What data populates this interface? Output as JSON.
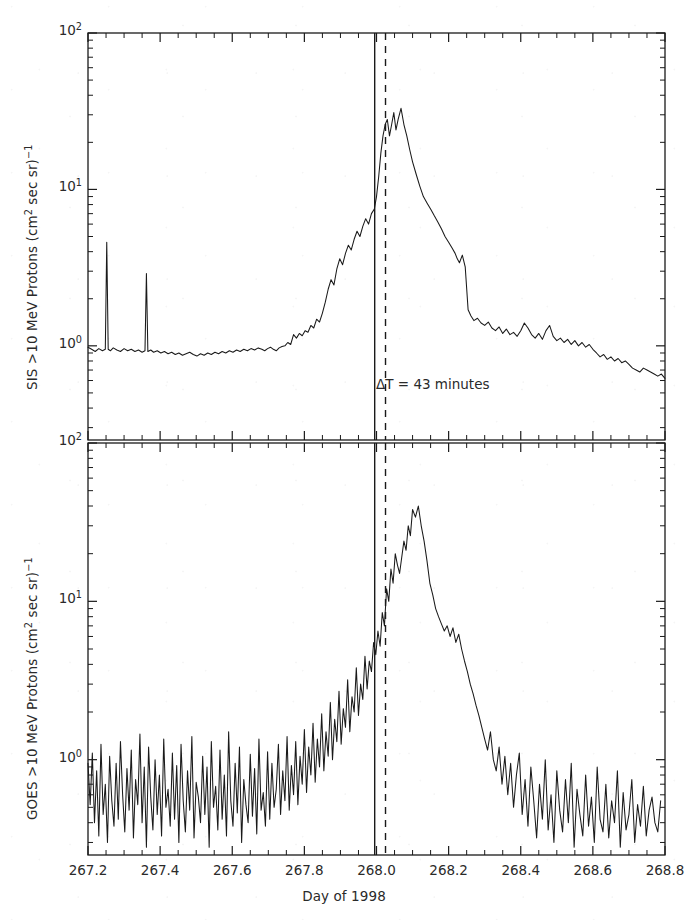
{
  "figure": {
    "background_color": "#ffffff",
    "line_color": "#1a1a1a",
    "width": 688,
    "height": 920
  },
  "xaxis": {
    "label": "Day of 1998",
    "tick_labels": [
      "267.2",
      "267.4",
      "267.6",
      "267.8",
      "268.0",
      "268.2",
      "268.4",
      "268.6",
      "268.8"
    ],
    "tick_values": [
      267.2,
      267.4,
      267.6,
      267.8,
      268.0,
      268.2,
      268.4,
      268.6,
      268.8
    ],
    "min": 267.2,
    "max": 268.8,
    "minor_ticks_per_interval": 4
  },
  "panels": [
    {
      "id": "sis-panel",
      "ylabel_parts": {
        "prefix": "SIS >10 MeV Protons (cm",
        "sup1": "2",
        "middle": " sec sr)",
        "sup2": "−1"
      },
      "ylabel_text": "SIS >10 MeV Protons (cm2 sec sr)−1",
      "ytick_labels": [
        {
          "mantissa": "10",
          "exponent": "0",
          "value": 1
        },
        {
          "mantissa": "10",
          "exponent": "1",
          "value": 10
        },
        {
          "mantissa": "10",
          "exponent": "2",
          "value": 100
        }
      ],
      "ymin": 0.25,
      "ymax": 100,
      "annotation": "ΔT  =  43  minutes",
      "markers": [
        {
          "name": "solid-onset-line",
          "x": 267.995,
          "style": "solid"
        },
        {
          "name": "dashed-onset-line",
          "x": 268.025,
          "style": "dashed"
        }
      ]
    },
    {
      "id": "goes-panel",
      "ylabel_parts": {
        "prefix": "GOES >10 MeV Protons (cm",
        "sup1": "2",
        "middle": " sec sr)",
        "sup2": "−1"
      },
      "ylabel_text": "GOES >10 MeV Protons (cm2 sec sr)−1",
      "ytick_labels": [
        {
          "mantissa": "10",
          "exponent": "0",
          "value": 1
        },
        {
          "mantissa": "10",
          "exponent": "1",
          "value": 10
        },
        {
          "mantissa": "10",
          "exponent": "2",
          "value": 100
        }
      ],
      "ymin": 0.25,
      "ymax": 100,
      "markers": [
        {
          "name": "solid-onset-line",
          "x": 267.995,
          "style": "solid"
        },
        {
          "name": "dashed-onset-line",
          "x": 268.025,
          "style": "dashed"
        }
      ]
    }
  ],
  "chart_data": [
    {
      "type": "line",
      "title": "",
      "panel": "top",
      "name": "SIS >10 MeV Protons",
      "xlabel": "Day of 1998",
      "ylabel": "SIS >10 MeV Protons (cm2 sec sr)-1",
      "xlim": [
        267.2,
        268.8
      ],
      "ylim": [
        0.25,
        100
      ],
      "yscale": "log",
      "xscale": "linear",
      "grid": false,
      "legend": "none",
      "annotations": [
        {
          "text": "ΔT  =  43  minutes",
          "x": 268.03,
          "y": 2.0
        }
      ],
      "vlines": [
        {
          "x": 267.995,
          "style": "solid"
        },
        {
          "x": 268.025,
          "style": "dashed"
        }
      ],
      "x": [
        267.2,
        267.21,
        267.22,
        267.23,
        267.24,
        267.248,
        267.252,
        267.256,
        267.262,
        267.27,
        267.28,
        267.29,
        267.3,
        267.31,
        267.32,
        267.33,
        267.34,
        267.35,
        267.358,
        267.362,
        267.366,
        267.374,
        267.382,
        267.392,
        267.402,
        267.412,
        267.422,
        267.432,
        267.442,
        267.452,
        267.462,
        267.472,
        267.482,
        267.492,
        267.502,
        267.512,
        267.522,
        267.532,
        267.542,
        267.552,
        267.562,
        267.572,
        267.582,
        267.592,
        267.602,
        267.612,
        267.622,
        267.632,
        267.642,
        267.652,
        267.662,
        267.672,
        267.682,
        267.69,
        267.698,
        267.706,
        267.714,
        267.722,
        267.73,
        267.738,
        267.746,
        267.754,
        267.762,
        267.77,
        267.778,
        267.786,
        267.794,
        267.802,
        267.81,
        267.818,
        267.826,
        267.834,
        267.842,
        267.85,
        267.858,
        267.866,
        267.874,
        267.882,
        267.89,
        267.898,
        267.906,
        267.914,
        267.922,
        267.93,
        267.938,
        267.946,
        267.954,
        267.962,
        267.97,
        267.978,
        267.986,
        267.994,
        268.0,
        268.006,
        268.012,
        268.018,
        268.024,
        268.03,
        268.036,
        268.042,
        268.048,
        268.054,
        268.06,
        268.068,
        268.076,
        268.084,
        268.092,
        268.1,
        268.11,
        268.12,
        268.13,
        268.14,
        268.15,
        268.16,
        268.17,
        268.18,
        268.19,
        268.2,
        268.21,
        268.218,
        268.224,
        268.23,
        268.238,
        268.246,
        268.254,
        268.262,
        268.27,
        268.28,
        268.29,
        268.3,
        268.31,
        268.32,
        268.33,
        268.34,
        268.35,
        268.36,
        268.37,
        268.38,
        268.39,
        268.4,
        268.41,
        268.42,
        268.43,
        268.44,
        268.45,
        268.46,
        268.47,
        268.48,
        268.49,
        268.5,
        268.51,
        268.52,
        268.53,
        268.54,
        268.55,
        268.56,
        268.57,
        268.58,
        268.59,
        268.6,
        268.61,
        268.62,
        268.63,
        268.64,
        268.65,
        268.66,
        268.67,
        268.68,
        268.69,
        268.7,
        268.71,
        268.72,
        268.73,
        268.74,
        268.75,
        268.76,
        268.77,
        268.78,
        268.79,
        268.8
      ],
      "y": [
        0.98,
        0.95,
        0.92,
        0.96,
        0.93,
        0.95,
        4.6,
        0.95,
        0.93,
        0.97,
        0.94,
        0.92,
        0.96,
        0.93,
        0.95,
        0.92,
        0.94,
        0.91,
        0.93,
        2.9,
        0.92,
        0.94,
        0.91,
        0.93,
        0.9,
        0.92,
        0.89,
        0.91,
        0.88,
        0.9,
        0.87,
        0.89,
        0.91,
        0.88,
        0.86,
        0.89,
        0.87,
        0.9,
        0.88,
        0.91,
        0.89,
        0.92,
        0.9,
        0.93,
        0.91,
        0.94,
        0.92,
        0.95,
        0.93,
        0.96,
        0.94,
        0.97,
        0.95,
        0.93,
        0.96,
        0.98,
        0.95,
        0.93,
        0.97,
        0.99,
        1.0,
        1.05,
        1.02,
        1.18,
        1.12,
        1.2,
        1.16,
        1.25,
        1.22,
        1.35,
        1.3,
        1.48,
        1.42,
        1.62,
        1.9,
        2.3,
        2.65,
        2.45,
        3.1,
        3.6,
        3.3,
        3.9,
        4.4,
        4.1,
        4.8,
        5.4,
        5.0,
        5.8,
        6.5,
        6.0,
        7.0,
        7.5,
        9.0,
        12.0,
        17.0,
        22.0,
        26.0,
        28.0,
        22.0,
        26.0,
        31.0,
        24.0,
        28.0,
        33.0,
        26.0,
        22.0,
        18.0,
        15.0,
        12.5,
        10.5,
        9.0,
        8.2,
        7.5,
        6.8,
        6.2,
        5.6,
        5.0,
        4.6,
        4.2,
        3.9,
        3.6,
        3.4,
        3.8,
        3.2,
        1.7,
        1.55,
        1.45,
        1.5,
        1.4,
        1.35,
        1.42,
        1.3,
        1.25,
        1.32,
        1.2,
        1.28,
        1.18,
        1.22,
        1.15,
        1.25,
        1.4,
        1.3,
        1.18,
        1.12,
        1.2,
        1.1,
        1.25,
        1.35,
        1.15,
        1.08,
        1.12,
        1.05,
        1.1,
        1.02,
        1.08,
        1.0,
        1.05,
        0.98,
        1.02,
        0.95,
        0.9,
        0.85,
        0.88,
        0.82,
        0.85,
        0.8,
        0.83,
        0.78,
        0.8,
        0.76,
        0.72,
        0.7,
        0.68,
        0.72,
        0.7,
        0.68,
        0.66,
        0.64,
        0.66,
        0.62
      ],
      "features": {
        "baseline_level": 0.93,
        "spikes": [
          {
            "x": 267.252,
            "y": 4.6
          },
          {
            "x": 267.362,
            "y": 2.9
          }
        ],
        "peak_value": 33.0,
        "peak_x": 268.048,
        "tail_level": 0.65
      }
    },
    {
      "type": "line",
      "title": "",
      "panel": "bottom",
      "name": "GOES >10 MeV Protons",
      "xlabel": "Day of 1998",
      "ylabel": "GOES >10 MeV Protons (cm2 sec sr)-1",
      "xlim": [
        267.2,
        268.8
      ],
      "ylim": [
        0.25,
        100
      ],
      "yscale": "log",
      "xscale": "linear",
      "grid": false,
      "legend": "none",
      "vlines": [
        {
          "x": 267.995,
          "style": "solid"
        },
        {
          "x": 268.025,
          "style": "dashed"
        }
      ],
      "x": [
        267.2,
        267.206,
        267.212,
        267.218,
        267.224,
        267.23,
        267.236,
        267.242,
        267.248,
        267.254,
        267.26,
        267.266,
        267.272,
        267.278,
        267.284,
        267.29,
        267.296,
        267.302,
        267.308,
        267.314,
        267.32,
        267.326,
        267.332,
        267.338,
        267.344,
        267.35,
        267.356,
        267.362,
        267.368,
        267.374,
        267.38,
        267.386,
        267.392,
        267.398,
        267.404,
        267.41,
        267.416,
        267.422,
        267.428,
        267.434,
        267.44,
        267.446,
        267.452,
        267.458,
        267.464,
        267.47,
        267.476,
        267.482,
        267.488,
        267.494,
        267.5,
        267.506,
        267.512,
        267.518,
        267.524,
        267.53,
        267.536,
        267.542,
        267.548,
        267.554,
        267.56,
        267.566,
        267.572,
        267.578,
        267.584,
        267.59,
        267.596,
        267.602,
        267.608,
        267.614,
        267.62,
        267.626,
        267.632,
        267.638,
        267.644,
        267.65,
        267.656,
        267.662,
        267.668,
        267.674,
        267.68,
        267.686,
        267.692,
        267.698,
        267.704,
        267.71,
        267.716,
        267.722,
        267.728,
        267.734,
        267.74,
        267.746,
        267.752,
        267.758,
        267.764,
        267.77,
        267.776,
        267.782,
        267.788,
        267.794,
        267.8,
        267.806,
        267.812,
        267.818,
        267.824,
        267.83,
        267.836,
        267.842,
        267.848,
        267.854,
        267.86,
        267.866,
        267.872,
        267.878,
        267.884,
        267.89,
        267.896,
        267.902,
        267.908,
        267.914,
        267.92,
        267.926,
        267.932,
        267.938,
        267.944,
        267.95,
        267.956,
        267.962,
        267.968,
        267.974,
        267.98,
        267.986,
        267.992,
        267.998,
        268.004,
        268.01,
        268.016,
        268.022,
        268.028,
        268.034,
        268.04,
        268.046,
        268.052,
        268.058,
        268.064,
        268.07,
        268.076,
        268.082,
        268.088,
        268.094,
        268.1,
        268.108,
        268.116,
        268.124,
        268.132,
        268.14,
        268.148,
        268.156,
        268.164,
        268.172,
        268.18,
        268.188,
        268.196,
        268.204,
        268.212,
        268.22,
        268.228,
        268.236,
        268.244,
        268.252,
        268.26,
        268.268,
        268.276,
        268.284,
        268.292,
        268.3,
        268.308,
        268.316,
        268.324,
        268.332,
        268.34,
        268.348,
        268.356,
        268.364,
        268.372,
        268.38,
        268.388,
        268.396,
        268.404,
        268.412,
        268.42,
        268.428,
        268.436,
        268.444,
        268.452,
        268.46,
        268.468,
        268.476,
        268.484,
        268.492,
        268.5,
        268.508,
        268.516,
        268.524,
        268.532,
        268.54,
        268.548,
        268.556,
        268.564,
        268.572,
        268.58,
        268.588,
        268.596,
        268.604,
        268.612,
        268.62,
        268.628,
        268.636,
        268.644,
        268.652,
        268.66,
        268.668,
        268.676,
        268.684,
        268.692,
        268.7,
        268.708,
        268.716,
        268.724,
        268.732,
        268.74,
        268.748,
        268.756,
        268.764,
        268.772,
        268.78,
        268.788,
        268.796,
        268.8
      ],
      "y": [
        0.95,
        0.52,
        1.1,
        0.4,
        0.85,
        0.33,
        1.25,
        0.45,
        0.7,
        0.3,
        1.05,
        0.55,
        0.38,
        0.95,
        0.42,
        1.3,
        0.6,
        0.35,
        0.88,
        0.48,
        1.15,
        0.32,
        0.75,
        0.52,
        1.45,
        0.4,
        0.9,
        0.28,
        1.2,
        0.58,
        0.36,
        1.0,
        0.45,
        0.8,
        0.33,
        1.35,
        0.5,
        0.65,
        0.38,
        1.1,
        0.42,
        0.92,
        0.3,
        1.25,
        0.55,
        0.35,
        0.85,
        0.48,
        1.4,
        0.32,
        0.72,
        0.58,
        0.4,
        1.05,
        0.45,
        0.9,
        0.28,
        1.3,
        0.5,
        0.68,
        0.36,
        1.15,
        0.42,
        0.8,
        0.33,
        1.5,
        0.55,
        0.38,
        0.95,
        0.46,
        1.2,
        0.3,
        0.75,
        0.52,
        0.4,
        1.08,
        0.44,
        0.88,
        0.34,
        1.35,
        0.48,
        0.62,
        0.38,
        1.12,
        0.42,
        0.95,
        0.5,
        0.65,
        1.25,
        0.45,
        0.85,
        0.55,
        1.4,
        0.48,
        0.92,
        0.6,
        1.3,
        0.52,
        1.05,
        0.7,
        1.55,
        0.62,
        1.2,
        0.8,
        1.7,
        0.72,
        1.35,
        0.9,
        1.95,
        0.85,
        1.5,
        1.05,
        2.3,
        1.0,
        1.8,
        1.3,
        2.7,
        1.25,
        2.1,
        1.6,
        3.2,
        1.5,
        2.5,
        2.0,
        3.8,
        1.9,
        3.0,
        2.4,
        4.5,
        2.8,
        4.2,
        3.6,
        5.5,
        4.6,
        6.5,
        5.2,
        8.5,
        7.0,
        12.0,
        10.0,
        16.0,
        13.0,
        20.0,
        17.0,
        15.0,
        19.0,
        24.0,
        21.0,
        30.0,
        26.0,
        38.0,
        34.0,
        40.0,
        30.0,
        24.0,
        18.0,
        13.0,
        11.0,
        9.0,
        8.0,
        7.2,
        6.5,
        7.0,
        6.0,
        6.8,
        5.5,
        6.2,
        5.0,
        4.2,
        3.6,
        3.0,
        2.6,
        2.2,
        1.9,
        1.6,
        1.35,
        1.15,
        1.5,
        1.0,
        0.85,
        1.2,
        0.7,
        1.05,
        0.6,
        0.95,
        0.5,
        0.8,
        1.1,
        0.45,
        0.75,
        0.38,
        0.9,
        0.55,
        0.32,
        0.7,
        0.42,
        1.0,
        0.36,
        0.6,
        0.3,
        0.85,
        0.48,
        0.35,
        0.75,
        0.4,
        0.95,
        0.28,
        0.65,
        0.45,
        0.33,
        0.8,
        0.38,
        0.58,
        0.3,
        0.9,
        0.42,
        0.35,
        0.7,
        0.32,
        0.55,
        0.4,
        0.85,
        0.28,
        0.62,
        0.36,
        0.45,
        0.75,
        0.3,
        0.52,
        0.38,
        0.68,
        0.33,
        0.48,
        0.58,
        0.4,
        0.35,
        0.55
      ],
      "features": {
        "baseline_level": 0.7,
        "baseline_noise": "high",
        "peak_value": 40.0,
        "peak_x": 268.064,
        "tail_level": 0.5
      }
    }
  ]
}
